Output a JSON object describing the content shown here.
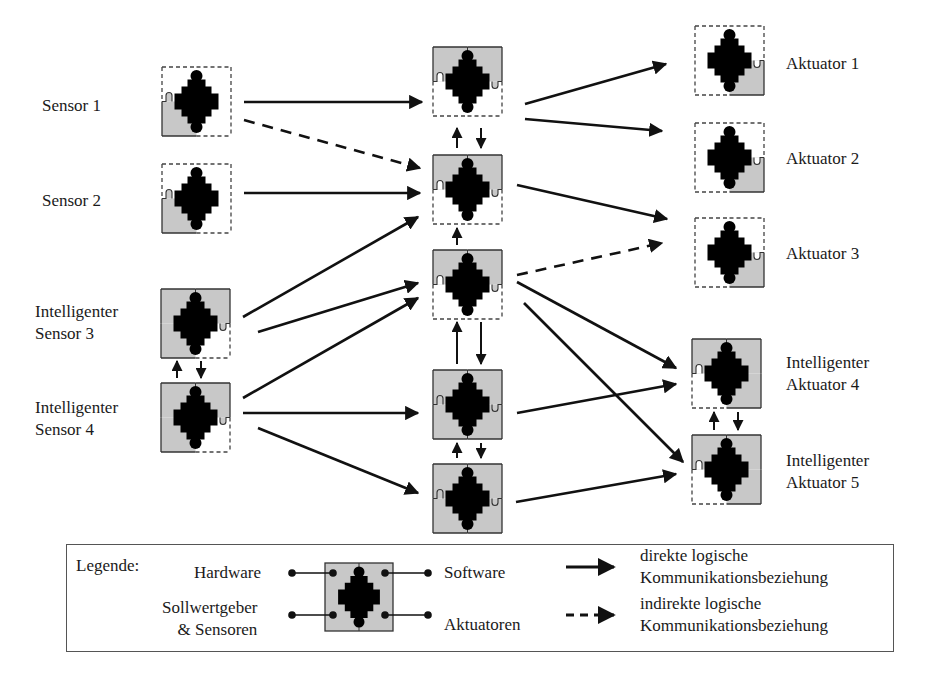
{
  "colors": {
    "hardware_fill": "#c8c8c8",
    "core": "#000000",
    "line": "#111111",
    "dashed_border": "#444444"
  },
  "nodes": {
    "sensors": [
      {
        "id": "s1",
        "label_lines": [
          "Sensor 1"
        ],
        "filled_quadrants": [
          "bl"
        ]
      },
      {
        "id": "s2",
        "label_lines": [
          "Sensor 2"
        ],
        "filled_quadrants": [
          "bl"
        ]
      },
      {
        "id": "s3",
        "label_lines": [
          "Intelligenter",
          "Sensor 3"
        ],
        "filled_quadrants": [
          "tl",
          "tr",
          "bl"
        ]
      },
      {
        "id": "s4",
        "label_lines": [
          "Intelligenter",
          "Sensor 4"
        ],
        "filled_quadrants": [
          "tl",
          "tr",
          "bl"
        ]
      }
    ],
    "middle": [
      {
        "id": "m1",
        "filled_quadrants": [
          "tl",
          "tr"
        ]
      },
      {
        "id": "m2",
        "filled_quadrants": [
          "tl",
          "tr"
        ]
      },
      {
        "id": "m3",
        "filled_quadrants": [
          "tl",
          "tr"
        ]
      },
      {
        "id": "m4",
        "filled_quadrants": [
          "tl",
          "tr",
          "bl",
          "br"
        ]
      },
      {
        "id": "m5",
        "filled_quadrants": [
          "tl",
          "tr",
          "bl",
          "br"
        ]
      }
    ],
    "actuators": [
      {
        "id": "a1",
        "label_lines": [
          "Aktuator 1"
        ],
        "filled_quadrants": [
          "br"
        ]
      },
      {
        "id": "a2",
        "label_lines": [
          "Aktuator 2"
        ],
        "filled_quadrants": [
          "br"
        ]
      },
      {
        "id": "a3",
        "label_lines": [
          "Aktuator 3"
        ],
        "filled_quadrants": [
          "br"
        ]
      },
      {
        "id": "a4",
        "label_lines": [
          "Intelligenter",
          "Aktuator 4"
        ],
        "filled_quadrants": [
          "tl",
          "tr",
          "br"
        ]
      },
      {
        "id": "a5",
        "label_lines": [
          "Intelligenter",
          "Aktuator 5"
        ],
        "filled_quadrants": [
          "tl",
          "tr",
          "br"
        ]
      }
    ]
  },
  "connections": [
    {
      "from": "s1",
      "to": "m1",
      "type": "direct"
    },
    {
      "from": "s1",
      "to": "m2",
      "type": "indirect"
    },
    {
      "from": "s2",
      "to": "m2",
      "type": "direct"
    },
    {
      "from": "s3",
      "to": "m2",
      "type": "direct"
    },
    {
      "from": "s3",
      "to": "m3",
      "type": "direct"
    },
    {
      "from": "s4",
      "to": "m3",
      "type": "direct"
    },
    {
      "from": "s4",
      "to": "m4",
      "type": "direct"
    },
    {
      "from": "s4",
      "to": "m5",
      "type": "direct"
    },
    {
      "from": "s3",
      "to": "s4",
      "type": "direct",
      "bidirectional": true
    },
    {
      "from": "m1",
      "to": "m2",
      "type": "direct",
      "bidirectional": true
    },
    {
      "from": "m2",
      "to": "m3",
      "type": "direct",
      "direction": "up"
    },
    {
      "from": "m3",
      "to": "m4",
      "type": "direct",
      "bidirectional": true
    },
    {
      "from": "m4",
      "to": "m5",
      "type": "direct",
      "bidirectional": true
    },
    {
      "from": "m1",
      "to": "a1",
      "type": "direct"
    },
    {
      "from": "m1",
      "to": "a2",
      "type": "direct"
    },
    {
      "from": "m2",
      "to": "a3",
      "type": "direct"
    },
    {
      "from": "m3",
      "to": "a3",
      "type": "indirect"
    },
    {
      "from": "m3",
      "to": "a4",
      "type": "direct"
    },
    {
      "from": "m3",
      "to": "a5",
      "type": "direct"
    },
    {
      "from": "m4",
      "to": "a4",
      "type": "direct"
    },
    {
      "from": "m5",
      "to": "a5",
      "type": "direct"
    },
    {
      "from": "a4",
      "to": "a5",
      "type": "direct",
      "bidirectional": true
    }
  ],
  "legend": {
    "title": "Legende:",
    "hardware": "Hardware",
    "software": "Software",
    "sensors_line1": "Sollwertgeber",
    "sensors_line2": "& Sensoren",
    "actuators": "Aktuatoren",
    "direct_line1": "direkte logische",
    "direct_line2": "Kommunikationsbeziehung",
    "indirect_line1": "indirekte logische",
    "indirect_line2": "Kommunikationsbeziehung"
  }
}
